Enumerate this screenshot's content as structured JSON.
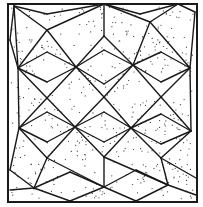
{
  "figure": {
    "title": "Geometric tessellation with stippled kites",
    "colors": {
      "background": "#ffffff",
      "line": "#1a1a1a",
      "stipple": "#3a3a3a"
    },
    "frame": {
      "x": 8,
      "y": 4,
      "width": 189,
      "height": 198
    },
    "star_vertices": [
      [
        14,
        6
      ],
      [
        104,
        4
      ],
      [
        178,
        4
      ],
      [
        18,
        68
      ],
      [
        76,
        67
      ],
      [
        133,
        65
      ],
      [
        190,
        68
      ],
      [
        19,
        128
      ],
      [
        75,
        127
      ],
      [
        131,
        128
      ],
      [
        191,
        131
      ],
      [
        34,
        188
      ],
      [
        104,
        187
      ],
      [
        168,
        185
      ]
    ],
    "kite_tips": [
      [
        47,
        30
      ],
      [
        104,
        36
      ],
      [
        150,
        22
      ],
      [
        195,
        12
      ],
      [
        47,
        98
      ],
      [
        104,
        97
      ],
      [
        161,
        97
      ],
      [
        47,
        158
      ],
      [
        104,
        157
      ],
      [
        161,
        158
      ]
    ]
  }
}
